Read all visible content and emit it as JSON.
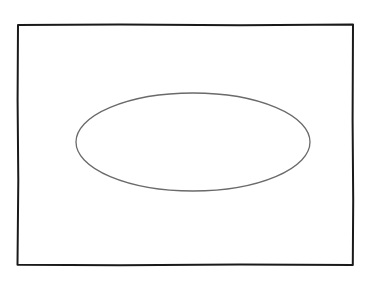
{
  "diagram": {
    "background": "#ffffff",
    "frame": {
      "x": 17,
      "y": 24,
      "width": 336,
      "height": 241,
      "stroke": "#1a1a1a",
      "stroke_width": 2
    },
    "ellipse": {
      "cx": 193,
      "cy": 142,
      "rx": 117,
      "ry": 49,
      "stroke": "#6a6a6a",
      "stroke_width": 1.3
    }
  }
}
